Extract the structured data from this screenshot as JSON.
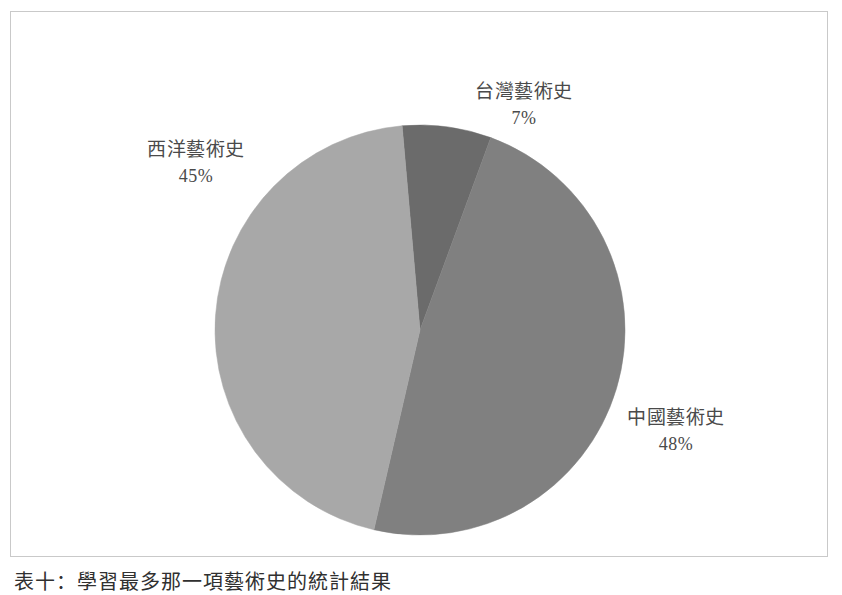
{
  "figure": {
    "caption": "表十：學習最多那一項藝術史的統計結果",
    "frame_color": "#c9c9c9",
    "background": "#ffffff"
  },
  "chart_data": {
    "type": "pie",
    "title": "",
    "subtitle": "",
    "xlabel": "",
    "ylabel": "",
    "legend_position": "none",
    "grid": false,
    "labels_outside": true,
    "start_angle_deg": -5,
    "direction": "clockwise",
    "center": {
      "x": 420,
      "y": 330
    },
    "radius": 205,
    "categories": [
      "台灣藝術史",
      "中國藝術史",
      "西洋藝術史"
    ],
    "values": [
      7,
      48,
      45
    ],
    "value_unit": "%",
    "colors": [
      "#6b6b6b",
      "#808080",
      "#a8a8a8"
    ],
    "slices": [
      {
        "name": "台灣藝術史",
        "value": 7,
        "value_label": "7%",
        "color": "#6b6b6b",
        "start_angle_deg": -5,
        "end_angle_deg": 20.2
      },
      {
        "name": "中國藝術史",
        "value": 48,
        "value_label": "48%",
        "color": "#808080",
        "start_angle_deg": 20.2,
        "end_angle_deg": 193.0
      },
      {
        "name": "西洋藝術史",
        "value": 45,
        "value_label": "45%",
        "color": "#a8a8a8",
        "start_angle_deg": 193.0,
        "end_angle_deg": 355.0
      }
    ]
  },
  "labels": {
    "taiwan": {
      "name": "台灣藝術史",
      "value": "7%"
    },
    "chinese": {
      "name": "中國藝術史",
      "value": "48%"
    },
    "western": {
      "name": "西洋藝術史",
      "value": "45%"
    }
  }
}
